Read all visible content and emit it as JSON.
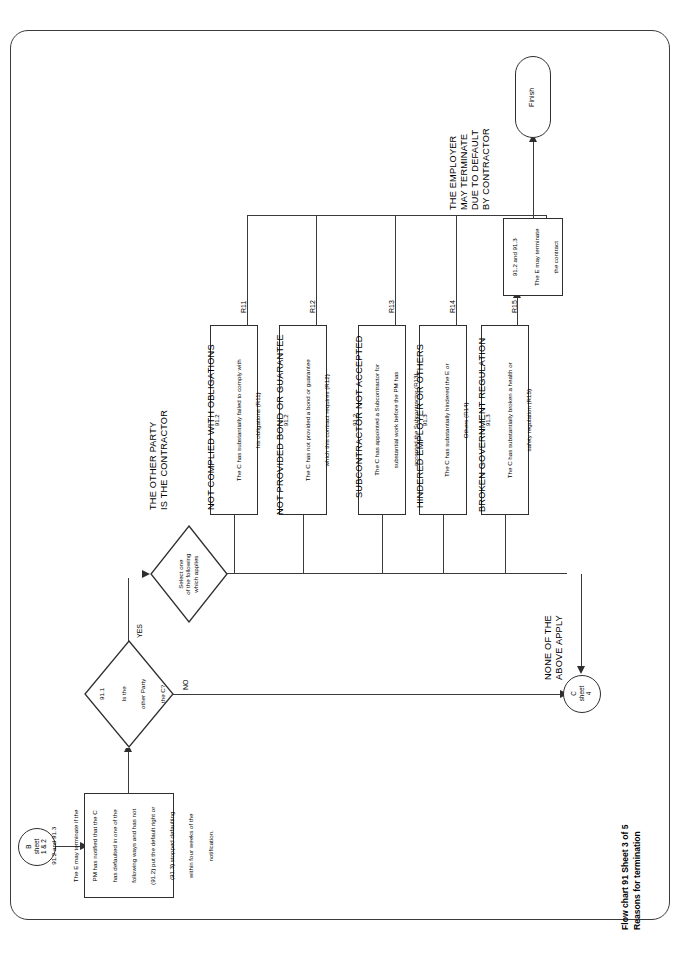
{
  "page": {
    "caption_line1": "Flow chart 91   Sheet 3 of 5",
    "caption_line2": "Reasons for termination"
  },
  "connectors": {
    "entry": {
      "id": "B",
      "line2": "sheet",
      "line3": "1 & 2"
    },
    "exit": {
      "id": "C",
      "line2": "sheet",
      "line3": "4"
    },
    "finish": {
      "label": "Finish"
    }
  },
  "nodes": {
    "intro": {
      "clause": "91.2 and 91.3",
      "body": [
        "The E may terminate if the",
        "PM has notified that the C",
        "has defaulted in one of the",
        "following ways and has not",
        "(91.2) put the default right or",
        "(91.3) stopped defaulting",
        "within four weeks of the",
        "notification."
      ]
    },
    "decision_party": {
      "clause": "91.1",
      "body": [
        "Is the",
        "other Party",
        "the C?"
      ],
      "yes_label": "YES",
      "no_label": "NO"
    },
    "decision_select": {
      "body": [
        "Select one",
        "of the following",
        "which applies"
      ]
    },
    "terminate": {
      "clause": "91.2 and 91.3",
      "body": [
        "The E may terminate",
        "the contract"
      ]
    }
  },
  "labels": {
    "other_party_is_contractor": [
      "THE OTHER PARTY",
      "IS THE CONTRACTOR"
    ],
    "employer_may_terminate": [
      "THE EMPLOYER",
      "MAY TERMINATE",
      "DUE TO DEFAULT",
      "BY CONTRACTOR"
    ],
    "none_of_the_above": [
      "NONE OF THE",
      "ABOVE APPLY"
    ]
  },
  "reasons": [
    {
      "heading": "NOT COMPLIED WITH OBLIGATIONS",
      "code": "R11",
      "clause": "91.2",
      "body": [
        "The C has substantially failed to comply with",
        "his obligations (R11)"
      ]
    },
    {
      "heading": "NOT PROVIDED BOND OR GUARANTEE",
      "code": "R12",
      "clause": "91.2",
      "body": [
        "The C has not provided a bond or guarantee",
        "which this contract requires (R12)"
      ]
    },
    {
      "heading": "SUBCONTRACTOR NOT ACCEPTED",
      "code": "R13",
      "clause": "91.2",
      "body": [
        "The C has appointed a Subcontractor for",
        "substantial work before the PM has",
        "accepted the Subcontractor (R13)"
      ]
    },
    {
      "heading": "HINDERED EMPLOYER OR OTHERS",
      "code": "R14",
      "clause": "91.3",
      "body": [
        "The C has substantially hindered the E or",
        "Others (R14)"
      ]
    },
    {
      "heading": "BROKEN GOVERNMENT REGULATION",
      "code": "R15",
      "clause": "91.3",
      "body": [
        "The C has substantially broken a health or",
        "safety regulation (R15)"
      ]
    }
  ],
  "colors": {
    "stroke": "#2e2e2e",
    "frame": "#3b3b3b",
    "background": "#ffffff"
  }
}
